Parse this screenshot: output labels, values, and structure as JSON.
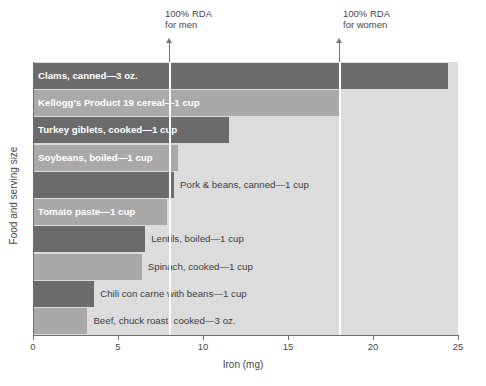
{
  "chart_data": {
    "type": "bar",
    "orientation": "horizontal",
    "title": "",
    "xlabel": "Iron (mg)",
    "ylabel": "Food and serving size",
    "xlim": [
      0,
      25
    ],
    "xticks": [
      "0",
      "5",
      "10",
      "15",
      "20",
      "25"
    ],
    "grid": false,
    "legend": "none",
    "categories": [
      "Clams, canned—3 oz.",
      "Kellogg's Product 19 cereal—1 cup",
      "Turkey giblets, cooked—1 cup",
      "Soybeans, boiled—1 cup",
      "Pork & beans, canned—1 cup",
      "Tomato paste—1 cup",
      "Lentils, boiled—1 cup",
      "Spinach, cooked—1 cup",
      "Chili con carne with beans—1 cup",
      "Beef, chuck roast, cooked—3 oz."
    ],
    "values": [
      24.4,
      18.0,
      11.5,
      8.5,
      8.3,
      7.9,
      6.6,
      6.4,
      3.6,
      3.2
    ],
    "bar_colors": [
      "#6b6b6b",
      "#a9a9a9",
      "#6b6b6b",
      "#a9a9a9",
      "#6b6b6b",
      "#a9a9a9",
      "#6b6b6b",
      "#a9a9a9",
      "#6b6b6b",
      "#a9a9a9"
    ],
    "label_placement": [
      "inside",
      "inside",
      "inside",
      "inside",
      "outside",
      "inside",
      "outside",
      "outside",
      "outside",
      "outside"
    ],
    "plot_background": "#dcdcdc",
    "annotations": [
      {
        "label_line1": "100% RDA",
        "label_line2": "for men",
        "value": 8.0
      },
      {
        "label_line1": "100% RDA",
        "label_line2": "for women",
        "value": 18.0
      }
    ]
  }
}
